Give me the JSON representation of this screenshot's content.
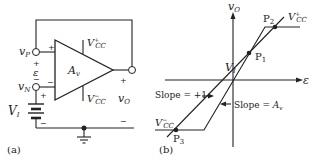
{
  "panel_a": {
    "caption": "(a)",
    "node_vp": "vP",
    "node_vn": "vN",
    "epsilon": "ε",
    "plus_p": "+",
    "minus_n": "−",
    "input_plus": "+",
    "input_minus": "−",
    "gain": "Av",
    "vcc_pos": "V+CC",
    "vcc_neg": "V−CC",
    "out_label": "vO",
    "out_plus": "+",
    "out_minus": "−",
    "source": "VI",
    "src_plus": "+",
    "src_minus": "−"
  },
  "panel_b": {
    "caption": "(b)",
    "y_axis": "vO",
    "x_axis": "ε",
    "p1": "P1",
    "p2": "P2",
    "p3": "P3",
    "vi": "VI",
    "vcc_pos": "V+CC",
    "vcc_neg": "V−CC",
    "slope1": "Slope = +1",
    "slope_av": "Slope = Av"
  }
}
